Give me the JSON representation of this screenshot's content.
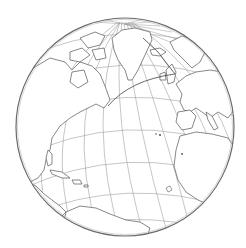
{
  "map": {
    "projection": "orthographic",
    "center_label": "North Atlantic Ocean",
    "globe": {
      "cx": 125,
      "cy": 127,
      "r": 109
    },
    "colors": {
      "background": "#ffffff",
      "ocean": "#ffffff",
      "land": "#ffffff",
      "coastline": "#555555",
      "graticule": "#9a9a9a",
      "outline": "#6a6a6a",
      "route": "#444444"
    },
    "graticule": {
      "spacing_deg": 10
    },
    "route": {
      "type": "great-circle",
      "from": "Newfoundland",
      "to": "Northern Europe"
    },
    "regions": [
      "North America",
      "Greenland",
      "Europe",
      "Africa",
      "Caribbean",
      "South America"
    ],
    "islands": [
      "Azores",
      "Madeira",
      "Canary Islands"
    ]
  }
}
